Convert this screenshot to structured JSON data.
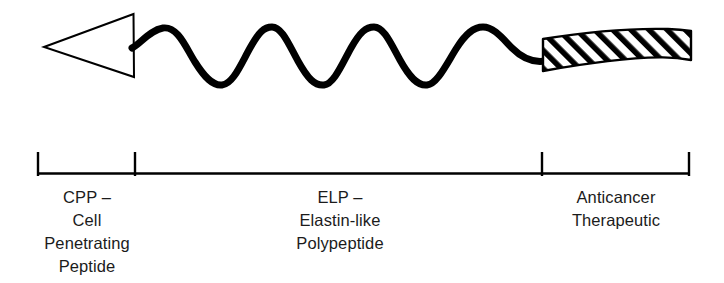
{
  "figure": {
    "background_color": "#ffffff",
    "stroke_color": "#000000",
    "text_color": "#1b1b1b"
  },
  "diagram": {
    "arrowhead": {
      "name": "cell-penetrating-peptide-arrowhead",
      "description": "Open left-pointing triangle outline",
      "fill": "#ffffff",
      "stroke": "#000000",
      "apex_x": 44,
      "apex_y": 47,
      "top_x": 133,
      "top_y": 14,
      "bottom_x": 134,
      "bottom_y": 77,
      "stroke_width": 2
    },
    "wave": {
      "name": "elastin-like-polypeptide-coil",
      "description": "Thick sinusoidal coil with four crests",
      "stroke": "#000000",
      "stroke_width": 7,
      "start_x": 133,
      "end_x": 545,
      "peak_y": 28,
      "trough_y": 85,
      "midline_y": 56,
      "cycles": 4,
      "period_px": 108
    },
    "ribbon": {
      "name": "anticancer-therapeutic-ribbon",
      "description": "Hatched curved ribbon / beta-sheet block",
      "fill": "#ffffff",
      "stroke": "#000000",
      "hatch_stroke": "#000000",
      "hatch_angle_deg": 45,
      "hatch_spacing_px": 9,
      "hatch_width_px": 4,
      "left_x": 542,
      "right_x": 691,
      "top_left_y": 39,
      "bottom_left_y": 71,
      "top_right_y": 31,
      "bottom_right_y": 60
    },
    "scale_bar": {
      "name": "domain-scale-bar",
      "stroke": "#000000",
      "line_y": 173,
      "line_start_x": 37,
      "line_end_x": 690,
      "tick_top_y": 152,
      "tick_bottom_y": 175,
      "tick_positions": [
        37,
        135,
        542,
        690
      ]
    }
  },
  "labels": {
    "cpp": {
      "abbrev": "CPP –",
      "lines": [
        "CPP –",
        "Cell",
        "Penetrating",
        "Peptide"
      ],
      "full_name": "Cell Penetrating Peptide",
      "segment_start_x": 37,
      "segment_end_x": 135
    },
    "elp": {
      "abbrev": "ELP –",
      "lines": [
        "ELP –",
        "Elastin-like",
        "Polypeptide"
      ],
      "full_name": "Elastin-like Polypeptide",
      "segment_start_x": 135,
      "segment_end_x": 542
    },
    "therapeutic": {
      "lines": [
        "Anticancer",
        "Therapeutic"
      ],
      "full_name": "Anticancer Therapeutic",
      "segment_start_x": 542,
      "segment_end_x": 690
    }
  }
}
